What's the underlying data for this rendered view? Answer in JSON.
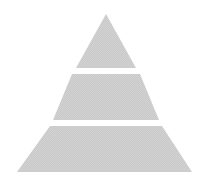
{
  "canvas": {
    "width": 210,
    "height": 187,
    "background_color": "#ffffff"
  },
  "diagram": {
    "name": "pyramid-diagram",
    "type": "pyramid",
    "title": "",
    "tier_count": 3,
    "orientation": "apex-up",
    "fill_color": "#c9c9c9",
    "fill_texture": "halftone-dither",
    "separator_color": "#ffffff",
    "separator_gap_px": 6,
    "apex": {
      "x": 106,
      "y": 14
    },
    "base": {
      "left_x": 17,
      "right_x": 192,
      "y": 172
    },
    "tiers": [
      {
        "id": "tier-1",
        "position": "top",
        "label": "",
        "shape": "triangle",
        "fill_color": "#c9c9c9",
        "top_y": 14,
        "bottom_y": 68,
        "top_left_x": 106,
        "top_right_x": 106,
        "bottom_left_x": 76,
        "bottom_right_x": 136,
        "points": "106,14 136,68 76,68"
      },
      {
        "id": "tier-2",
        "position": "middle",
        "label": "",
        "shape": "trapezoid",
        "fill_color": "#c9c9c9",
        "top_y": 74,
        "bottom_y": 120,
        "top_left_x": 72,
        "top_right_x": 140,
        "bottom_left_x": 53,
        "bottom_right_x": 159,
        "points": "72,74 140,74 159,120 53,120"
      },
      {
        "id": "tier-3",
        "position": "bottom",
        "label": "",
        "shape": "trapezoid",
        "fill_color": "#c9c9c9",
        "top_y": 126,
        "bottom_y": 172,
        "top_left_x": 50,
        "top_right_x": 162,
        "bottom_left_x": 17,
        "bottom_right_x": 192,
        "points": "50,126 162,126 192,172 17,172"
      }
    ]
  }
}
